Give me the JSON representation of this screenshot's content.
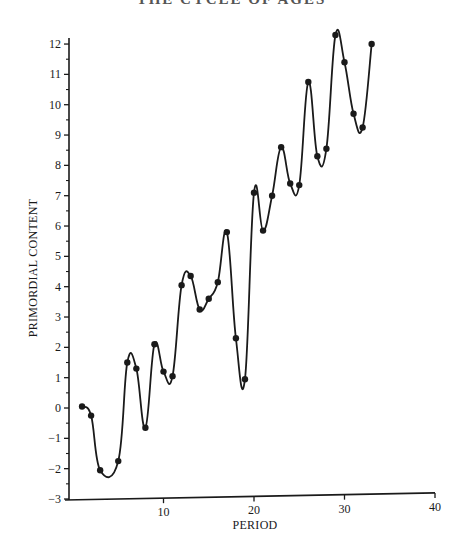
{
  "chart_data": {
    "type": "line",
    "title": "",
    "xlabel": "PERIOD",
    "ylabel": "PRIMORDIAL CONTENT",
    "xlim": [
      0,
      40
    ],
    "ylim": [
      -3,
      12
    ],
    "x_ticks": [
      10,
      20,
      30,
      40
    ],
    "y_ticks": [
      -3,
      -2,
      -1,
      0,
      1,
      2,
      3,
      4,
      5,
      6,
      7,
      8,
      9,
      10,
      11,
      12
    ],
    "y_minor_step": 0.5,
    "grid": false,
    "legend": null,
    "markers": "filled-circle",
    "smooth": true,
    "series": [
      {
        "name": "Primordial content",
        "points": [
          {
            "x": 1,
            "y": 0.05
          },
          {
            "x": 2,
            "y": -0.25
          },
          {
            "x": 3,
            "y": -2.05
          },
          {
            "x": 5,
            "y": -1.75
          },
          {
            "x": 6,
            "y": 1.5
          },
          {
            "x": 7,
            "y": 1.3
          },
          {
            "x": 8,
            "y": -0.65
          },
          {
            "x": 9,
            "y": 2.1
          },
          {
            "x": 10,
            "y": 1.2
          },
          {
            "x": 11,
            "y": 1.05
          },
          {
            "x": 12,
            "y": 4.05
          },
          {
            "x": 13,
            "y": 4.35
          },
          {
            "x": 14,
            "y": 3.25
          },
          {
            "x": 15,
            "y": 3.6
          },
          {
            "x": 16,
            "y": 4.15
          },
          {
            "x": 17,
            "y": 5.8
          },
          {
            "x": 18,
            "y": 2.3
          },
          {
            "x": 19,
            "y": 0.95
          },
          {
            "x": 20,
            "y": 7.1
          },
          {
            "x": 21,
            "y": 5.85
          },
          {
            "x": 22,
            "y": 7.0
          },
          {
            "x": 23,
            "y": 8.6
          },
          {
            "x": 24,
            "y": 7.4
          },
          {
            "x": 25,
            "y": 7.35
          },
          {
            "x": 26,
            "y": 10.75
          },
          {
            "x": 27,
            "y": 8.3
          },
          {
            "x": 28,
            "y": 8.55
          },
          {
            "x": 29,
            "y": 12.3
          },
          {
            "x": 30,
            "y": 11.4
          },
          {
            "x": 31,
            "y": 9.7
          },
          {
            "x": 32,
            "y": 9.25
          },
          {
            "x": 33,
            "y": 12.0
          }
        ]
      }
    ]
  },
  "header": {
    "cut_title": "THE CYCLE OF AGES"
  }
}
